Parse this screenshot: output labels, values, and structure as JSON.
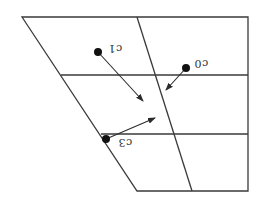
{
  "diagram": {
    "type": "vector-field-on-grid",
    "frame": {
      "outline": [
        [
          22,
          17
        ],
        [
          248,
          17
        ],
        [
          248,
          191
        ],
        [
          137,
          191
        ]
      ],
      "inner_line": [
        [
          137,
          17
        ],
        [
          192,
          191
        ]
      ],
      "horizontal_lines": [
        {
          "y": 75,
          "x1": 61,
          "x2": 248
        },
        {
          "y": 134,
          "x1": 101,
          "x2": 248
        }
      ]
    },
    "points": [
      {
        "id": "c1",
        "label": "c1",
        "dot": [
          98,
          52
        ],
        "arrow_to": [
          143,
          101
        ],
        "label_pos": [
          108,
          43
        ]
      },
      {
        "id": "c0",
        "label": "c0",
        "dot": [
          186,
          68
        ],
        "arrow_to": [
          166,
          90
        ],
        "label_pos": [
          194,
          58
        ]
      },
      {
        "id": "c3",
        "label": "c3",
        "dot": [
          106,
          139
        ],
        "arrow_to": [
          155,
          118
        ],
        "label_pos": [
          118,
          137
        ]
      }
    ],
    "colors": {
      "line": "#3a3a3a",
      "dot": "#111111",
      "background": "#ffffff"
    }
  }
}
